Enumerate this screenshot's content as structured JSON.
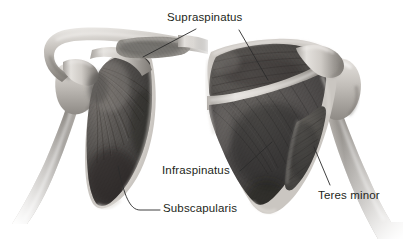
{
  "figure": {
    "background_color": "#ffffff",
    "ink_color": "#231f20",
    "leader_line_color": "#2b2b2b"
  },
  "labels": {
    "supraspinatus": "Supraspinatus",
    "infraspinatus": "Infraspinatus",
    "subscapularis": "Subscapularis",
    "teres_minor": "Teres minor"
  },
  "views": [
    {
      "name": "anterior-view-left",
      "structures": [
        "clavicle",
        "acromion",
        "coracoid process",
        "humerus",
        "scapula",
        "subscapularis muscle",
        "supraspinatus tendon"
      ]
    },
    {
      "name": "posterior-view-right",
      "structures": [
        "acromion",
        "scapular spine",
        "humerus",
        "scapula",
        "supraspinatus muscle",
        "infraspinatus muscle",
        "teres minor muscle"
      ]
    }
  ],
  "leader_lines": [
    {
      "label": "supraspinatus",
      "from": [
        196,
        29
      ],
      "to": [
        143,
        57
      ]
    },
    {
      "label": "supraspinatus",
      "from": [
        238,
        29
      ],
      "to": [
        268,
        80
      ]
    },
    {
      "label": "infraspinatus",
      "from": [
        240,
        172
      ],
      "to": [
        272,
        142
      ]
    },
    {
      "label": "subscapularis",
      "from": [
        159,
        210
      ],
      "to": [
        118,
        165
      ]
    },
    {
      "label": "teres_minor",
      "from": [
        330,
        186
      ],
      "to": [
        313,
        147
      ]
    }
  ],
  "palette": {
    "bone_light": "#e9e7e4",
    "bone_mid": "#bdb9b4",
    "bone_shadow": "#8c8882",
    "muscle_dark": "#4a4846",
    "muscle_mid": "#6f6c68",
    "muscle_deep": "#2f2e2d"
  }
}
